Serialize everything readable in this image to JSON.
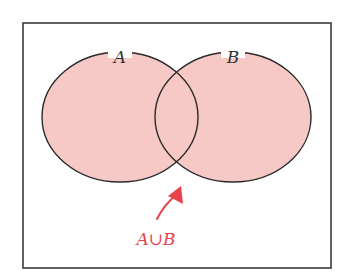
{
  "diagram": {
    "type": "venn",
    "universe": {
      "x": 23,
      "y": 23,
      "width": 308,
      "height": 245,
      "stroke": "#3a3a3a"
    },
    "fill_color": "#f6c9c6",
    "stroke_color": "#2a2a2a",
    "sets": [
      {
        "label": "A",
        "cx": 120,
        "cy": 117,
        "rx": 78,
        "ry": 65
      },
      {
        "label": "B",
        "cx": 233,
        "cy": 117,
        "rx": 78,
        "ry": 65
      }
    ],
    "annotation": {
      "label": "A∪B",
      "color": "#e8434a"
    }
  }
}
